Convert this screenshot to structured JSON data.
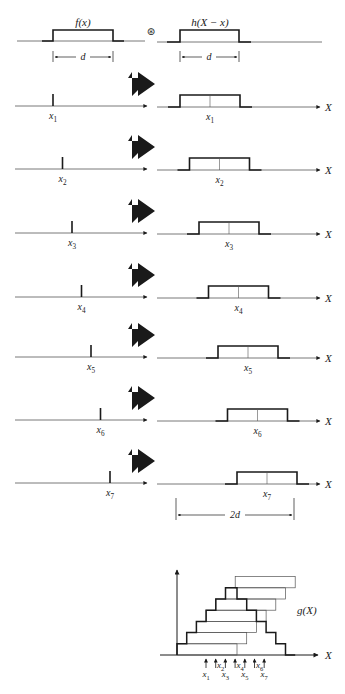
{
  "figure": {
    "header": {
      "f_label": "f(x)",
      "h_label": "h(X − x)",
      "convolution_symbol": "⊛",
      "width_label": "d"
    },
    "axis_label": "X",
    "rows": [
      {
        "impulse_label": "x",
        "impulse_sub": "1",
        "position": 1
      },
      {
        "impulse_label": "x",
        "impulse_sub": "2",
        "position": 2
      },
      {
        "impulse_label": "x",
        "impulse_sub": "3",
        "position": 3
      },
      {
        "impulse_label": "x",
        "impulse_sub": "4",
        "position": 4
      },
      {
        "impulse_label": "x",
        "impulse_sub": "5",
        "position": 5
      },
      {
        "impulse_label": "x",
        "impulse_sub": "6",
        "position": 6
      },
      {
        "impulse_label": "x",
        "impulse_sub": "7",
        "position": 7
      }
    ],
    "span_label": "2d",
    "result": {
      "label": "g(X)",
      "axis_label": "X",
      "tick_labels": [
        {
          "label": "x",
          "sub": "1",
          "side": "below"
        },
        {
          "label": "x",
          "sub": "2",
          "side": "above"
        },
        {
          "label": "x",
          "sub": "3",
          "side": "below"
        },
        {
          "label": "x",
          "sub": "4",
          "side": "above"
        },
        {
          "label": "x",
          "sub": "5",
          "side": "below"
        },
        {
          "label": "x",
          "sub": "6",
          "side": "above"
        },
        {
          "label": "x",
          "sub": "7",
          "side": "below"
        }
      ]
    },
    "colors": {
      "ink": "#1a1a1a",
      "paper": "#ffffff",
      "thin": "#555555"
    }
  }
}
